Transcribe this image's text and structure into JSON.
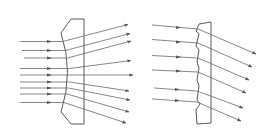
{
  "diagram": {
    "title": "Refraction of parallel light rays through a concave lens and a stepped (Fresnel) lens",
    "colors": {
      "stroke": "#5a5a5a",
      "ray": "#6a6a6a",
      "background": "#ffffff"
    },
    "panels": [
      {
        "id": "concave-lens",
        "label": "Concave lens",
        "incoming_ray_count": 9,
        "outgoing_ray_count": 9,
        "behavior": "diverging"
      },
      {
        "id": "fresnel-lens",
        "label": "Stepped (Fresnel) lens",
        "incoming_ray_count": 6,
        "outgoing_ray_count": 6,
        "behavior": "parallel deflection downward"
      }
    ]
  }
}
